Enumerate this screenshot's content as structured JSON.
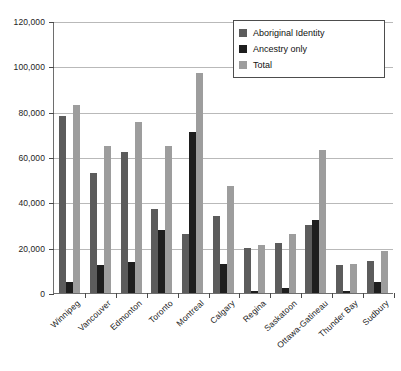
{
  "chart_data": {
    "type": "bar",
    "title": "",
    "xlabel": "",
    "ylabel": "",
    "ylim": [
      0,
      120000
    ],
    "ytick_values": [
      0,
      20000,
      40000,
      60000,
      80000,
      100000,
      120000
    ],
    "ytick_labels": [
      "0",
      "20,000",
      "40,000",
      "60,000",
      "80,000",
      "100,000",
      "120,000"
    ],
    "grid": true,
    "legend_position": "top-right",
    "categories": [
      "Winnipeg",
      "Vancouver",
      "Edmonton",
      "Toronto",
      "Montreal",
      "Calgary",
      "Regina",
      "Saskatoon",
      "Ottawa-Gatineau",
      "Thunder Bay",
      "Sudbury"
    ],
    "series": [
      {
        "name": "Aboriginal Identity",
        "color": "#5c5c5c",
        "values": [
          78000,
          53000,
          62000,
          37000,
          26000,
          34000,
          20000,
          22000,
          30000,
          12500,
          14000
        ]
      },
      {
        "name": "Ancestry only",
        "color": "#1e1e1e",
        "values": [
          5000,
          12500,
          13500,
          28000,
          71000,
          13000,
          1000,
          2000,
          32000,
          1000,
          5000
        ]
      },
      {
        "name": "Total",
        "color": "#9d9d9d",
        "values": [
          83000,
          65000,
          75500,
          65000,
          97000,
          47000,
          21000,
          26000,
          63000,
          13000,
          18500
        ]
      }
    ]
  },
  "legend": {
    "items": [
      {
        "label": "Aboriginal Identity"
      },
      {
        "label": "Ancestry only"
      },
      {
        "label": "Total"
      }
    ]
  },
  "colors": {
    "series_aboriginal_identity": "#5c5c5c",
    "series_ancestry_only": "#1e1e1e",
    "series_total": "#9d9d9d",
    "axis": "#6e6e6e",
    "gridline": "#b9b9b9",
    "background": "#ffffff"
  }
}
